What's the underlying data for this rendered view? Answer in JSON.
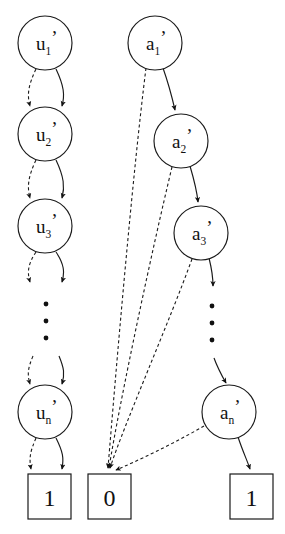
{
  "diagram": {
    "background_color": "#ffffff",
    "stroke_color": "#1a1a1a",
    "width": 285,
    "height": 534,
    "u_chain": {
      "name": "u-chain",
      "nodes": [
        {
          "id": "u1",
          "base": "u",
          "sub": "1",
          "prime": "’",
          "cx": 45,
          "cy": 43,
          "r": 27
        },
        {
          "id": "u2",
          "base": "u",
          "sub": "2",
          "prime": "’",
          "cx": 45,
          "cy": 134,
          "r": 27
        },
        {
          "id": "u3",
          "base": "u",
          "sub": "3",
          "prime": "’",
          "cx": 45,
          "cy": 226,
          "r": 27
        },
        {
          "id": "un",
          "base": "u",
          "sub": "n",
          "prime": "’",
          "cx": 45,
          "cy": 412,
          "r": 27
        }
      ],
      "ellipsis_dots": [
        {
          "cx": 46,
          "cy": 304,
          "r": 2.4
        },
        {
          "cx": 46,
          "cy": 321,
          "r": 2.4
        },
        {
          "cx": 46,
          "cy": 338,
          "r": 2.4
        }
      ]
    },
    "a_chain": {
      "name": "a-chain",
      "nodes": [
        {
          "id": "a1",
          "base": "a",
          "sub": "1",
          "prime": "’",
          "cx": 155,
          "cy": 43,
          "r": 27
        },
        {
          "id": "a2",
          "base": "a",
          "sub": "2",
          "prime": "’",
          "cx": 181,
          "cy": 141,
          "r": 27
        },
        {
          "id": "a3",
          "base": "a",
          "sub": "3",
          "prime": "’",
          "cx": 201,
          "cy": 233,
          "r": 27
        },
        {
          "id": "an",
          "base": "a",
          "sub": "n",
          "prime": "’",
          "cx": 229,
          "cy": 412,
          "r": 27
        }
      ],
      "ellipsis_dots": [
        {
          "cx": 212,
          "cy": 306,
          "r": 2.4
        },
        {
          "cx": 212,
          "cy": 323,
          "r": 2.4
        },
        {
          "cx": 212,
          "cy": 340,
          "r": 2.4
        }
      ]
    },
    "terminals": [
      {
        "id": "box-left",
        "label": "1",
        "x": 28,
        "y": 474,
        "w": 43,
        "h": 45
      },
      {
        "id": "box-middle",
        "label": "0",
        "x": 88,
        "y": 474,
        "w": 43,
        "h": 45
      },
      {
        "id": "box-right",
        "label": "1",
        "x": 230,
        "y": 474,
        "w": 43,
        "h": 45
      }
    ],
    "edges": {
      "u_pairs": [
        {
          "from": "u1",
          "to": "u2",
          "dashed_path": "M 36 69 C 28 86, 27 95, 30 106",
          "solid_path": "M 56 69 C 64 86, 65 95, 62 106"
        },
        {
          "from": "u2",
          "to": "u3",
          "dashed_path": "M 36 160 C 28 177, 27 187, 30 198",
          "solid_path": "M 56 160 C 64 177, 65 187, 62 198"
        },
        {
          "from": "u3",
          "to": "dots",
          "dashed_path": "M 36 252 C 28 264, 27 272, 30 282",
          "solid_path": "M 56 252 C 64 264, 65 272, 62 282"
        },
        {
          "from": "dots",
          "to": "un",
          "dashed_path": "M 33 356 C 28 368, 27 374, 30 384",
          "solid_path": "M 59 356 C 64 368, 65 374, 62 384"
        },
        {
          "from": "un",
          "to": "box-left",
          "dashed_path": "M 36 438 C 30 452, 29 458, 31 469",
          "solid_path": "M 56 438 C 63 452, 64 458, 62 469"
        }
      ],
      "a_solid": [
        {
          "from": "a1",
          "to": "a2",
          "path": "M 163 68 C 169 85, 172 97, 175 110"
        },
        {
          "from": "a2",
          "to": "a3",
          "path": "M 190 166 C 195 183, 197 192, 198 202"
        },
        {
          "from": "a3",
          "to": "dots",
          "path": "M 209 258 C 212 270, 213 278, 213 286"
        },
        {
          "from": "dots",
          "to": "an",
          "path": "M 214 358 C 218 369, 222 376, 226 383"
        },
        {
          "from": "an",
          "to": "box-right",
          "path": "M 238 437 C 243 452, 247 460, 250 469"
        }
      ],
      "a_dashed_to_zero": [
        {
          "from": "a1",
          "to": "box-middle",
          "path": "M 146 68 C 132 180, 116 370, 108 468"
        },
        {
          "from": "a2",
          "to": "box-middle",
          "path": "M 172 167 C 152 250, 120 400, 109 468"
        },
        {
          "from": "a3",
          "to": "box-middle",
          "path": "M 192 259 C 170 320, 124 425, 110 468"
        },
        {
          "from": "an",
          "to": "box-middle",
          "path": "M 204 426 C 175 443, 135 462, 116 470"
        }
      ]
    }
  }
}
